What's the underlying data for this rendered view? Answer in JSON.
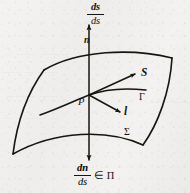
{
  "figure": {
    "name": "surface-normal-diagram",
    "background_color": "#f2f1ef",
    "ink_color": "#17150f"
  },
  "labels": {
    "top_derivative": {
      "numerator": "ds",
      "denominator": "ds"
    },
    "bottom_derivative": {
      "numerator": "dn",
      "denominator": "ds",
      "membership": "∈ Π"
    },
    "normal_vector": "n",
    "tangent_vector_S": "S",
    "tangent_vector_l": "l",
    "point": "P",
    "curve": "Γ",
    "surface": "Σ"
  },
  "bleed_through": [
    "― ―― ―――",
    "―― ― ――",
    "――― ――",
    "― ――― ―",
    "―― ――"
  ]
}
